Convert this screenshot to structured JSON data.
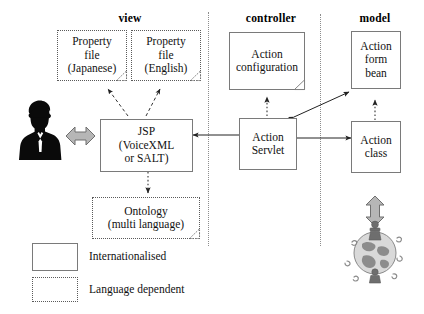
{
  "diagram": {
    "columns": [
      {
        "id": "view",
        "label": "view"
      },
      {
        "id": "controller",
        "label": "controller"
      },
      {
        "id": "model",
        "label": "model"
      }
    ],
    "nodes": [
      {
        "id": "property-file-japanese",
        "lines": [
          "Property",
          "file",
          "(Japanese)"
        ],
        "style": "language-dependent",
        "folded_corner": true,
        "column": "view"
      },
      {
        "id": "property-file-english",
        "lines": [
          "Property",
          "file",
          "(English)"
        ],
        "style": "language-dependent",
        "folded_corner": true,
        "column": "view"
      },
      {
        "id": "jsp",
        "lines": [
          "JSP",
          "(VoiceXML",
          "or SALT)"
        ],
        "style": "internationalised",
        "folded_corner": false,
        "column": "view"
      },
      {
        "id": "ontology",
        "lines": [
          "Ontology",
          "(multi language)"
        ],
        "style": "language-dependent",
        "folded_corner": true,
        "column": "view"
      },
      {
        "id": "action-configuration",
        "lines": [
          "Action",
          "configuration"
        ],
        "style": "internationalised",
        "folded_corner": true,
        "column": "controller"
      },
      {
        "id": "action-servlet",
        "lines": [
          "Action",
          "Servlet"
        ],
        "style": "internationalised",
        "folded_corner": false,
        "column": "controller"
      },
      {
        "id": "action-form-bean",
        "lines": [
          "Action",
          "form",
          "bean"
        ],
        "style": "internationalised",
        "folded_corner": false,
        "column": "model"
      },
      {
        "id": "action-class",
        "lines": [
          "Action",
          "class"
        ],
        "style": "internationalised",
        "folded_corner": false,
        "column": "model"
      }
    ],
    "legend": [
      {
        "id": "internationalised",
        "label": "Internationalised",
        "style": "internationalised"
      },
      {
        "id": "language-dependent",
        "label": "Language dependent",
        "style": "language-dependent"
      }
    ],
    "artwork": [
      {
        "id": "user-silhouette",
        "name": "user-silhouette-icon"
      },
      {
        "id": "globe",
        "name": "globe-with-people-icon"
      }
    ],
    "connectors": [
      {
        "id": "jsp-to-property-file-japanese",
        "from": "jsp",
        "to": "property-file-japanese",
        "line": "dashed",
        "heads": 1
      },
      {
        "id": "jsp-to-property-file-english",
        "from": "jsp",
        "to": "property-file-english",
        "line": "dashed",
        "heads": 1
      },
      {
        "id": "jsp-to-ontology",
        "from": "jsp",
        "to": "ontology",
        "line": "dotted",
        "heads": 1
      },
      {
        "id": "user-to-jsp",
        "from": "user-silhouette",
        "to": "jsp",
        "line": "block",
        "heads": 2
      },
      {
        "id": "action-servlet-to-jsp",
        "from": "action-servlet",
        "to": "jsp",
        "line": "solid",
        "heads": 1
      },
      {
        "id": "action-servlet-to-action-configuration",
        "from": "action-servlet",
        "to": "action-configuration",
        "line": "dotted",
        "heads": 1
      },
      {
        "id": "action-servlet-to-action-form-bean",
        "from": "action-servlet",
        "to": "action-form-bean",
        "line": "solid",
        "heads": 2
      },
      {
        "id": "action-servlet-to-action-class",
        "from": "action-servlet",
        "to": "action-class",
        "line": "solid",
        "heads": 2
      },
      {
        "id": "action-class-to-action-form-bean",
        "from": "action-class",
        "to": "action-form-bean",
        "line": "dotted",
        "heads": 1
      },
      {
        "id": "action-class-to-globe",
        "from": "action-class",
        "to": "globe",
        "line": "block",
        "heads": 2
      }
    ],
    "colors": {
      "box_stroke": "#7a7a7a",
      "dotted_stroke": "#5a5a5a",
      "divider": "#8d8d8d",
      "arrow": "#222222",
      "block_arrow_fill": "#b6b6b6",
      "block_arrow_stroke": "#6f6f6f",
      "text": "#111111",
      "background": "#ffffff"
    }
  }
}
